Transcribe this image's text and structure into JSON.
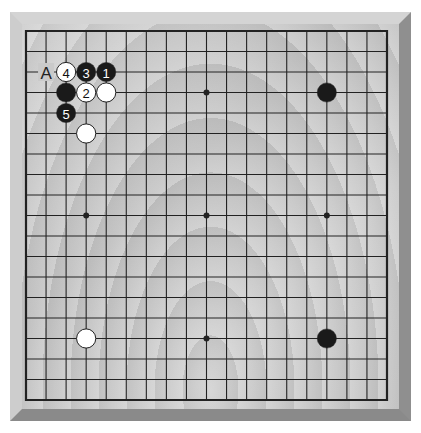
{
  "board": {
    "size": 19,
    "colors": {
      "line": "#222222",
      "black_stone": "#1a1a1a",
      "white_stone": "#ffffff",
      "stone_outline": "#222222",
      "hoshi": "#222222"
    },
    "hoshi": [
      [
        3,
        3
      ],
      [
        3,
        9
      ],
      [
        3,
        15
      ],
      [
        9,
        3
      ],
      [
        9,
        9
      ],
      [
        9,
        15
      ],
      [
        15,
        3
      ],
      [
        15,
        9
      ],
      [
        15,
        15
      ]
    ],
    "stones": [
      {
        "color": "black",
        "col": 4,
        "row": 2,
        "label": "1"
      },
      {
        "color": "white",
        "col": 3,
        "row": 3,
        "label": "2"
      },
      {
        "color": "black",
        "col": 3,
        "row": 2,
        "label": "3"
      },
      {
        "color": "white",
        "col": 2,
        "row": 2,
        "label": "4"
      },
      {
        "color": "black",
        "col": 2,
        "row": 4,
        "label": "5"
      },
      {
        "color": "black",
        "col": 2,
        "row": 3,
        "label": ""
      },
      {
        "color": "white",
        "col": 4,
        "row": 3,
        "label": ""
      },
      {
        "color": "white",
        "col": 3,
        "row": 5,
        "label": ""
      },
      {
        "color": "black",
        "col": 15,
        "row": 3,
        "label": ""
      },
      {
        "color": "white",
        "col": 3,
        "row": 15,
        "label": ""
      },
      {
        "color": "black",
        "col": 15,
        "row": 15,
        "label": ""
      }
    ],
    "marks": [
      {
        "col": 1,
        "row": 2,
        "text": "A"
      }
    ]
  }
}
